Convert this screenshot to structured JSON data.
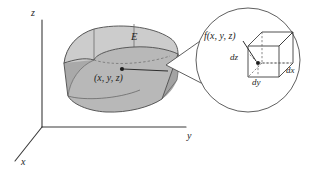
{
  "figure": {
    "kind": "math-diagram",
    "background_color": "#ffffff",
    "ink_color": "#2e2e2e"
  },
  "axes": {
    "z_label": "z",
    "y_label": "y",
    "x_label": "x",
    "origin": {
      "x": 42,
      "y": 127
    }
  },
  "solid": {
    "label": "E",
    "sample_point_label": "(x, y, z)",
    "fill_top": "#c9c9c9",
    "fill_front": "#b2b2b2",
    "fill_side": "#9f9f9f"
  },
  "magnifier": {
    "function_label": "f(x, y, z)",
    "dz_label": "dz",
    "dy_label": "dy",
    "dx_label": "dx",
    "circle": {
      "cx": 248,
      "cy": 60,
      "r": 52
    }
  }
}
